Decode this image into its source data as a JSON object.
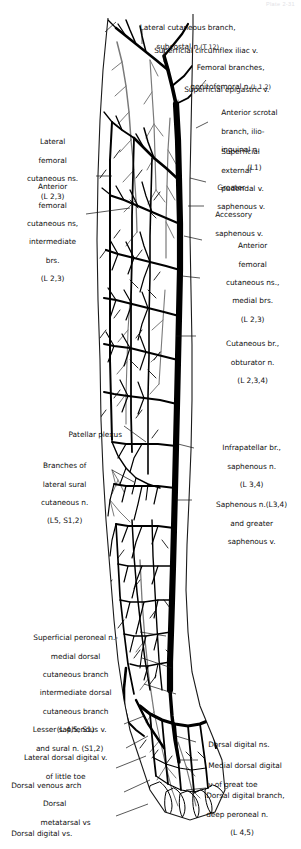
{
  "plate": {
    "header": "Plate 2-31",
    "title": "Superficial veins and cutaneous nerves of the lower limb, anterior view",
    "width": 301,
    "height": 849,
    "ink_color": "#000000",
    "nerve_color": "#6b6b6b",
    "background": "#ffffff"
  },
  "labels": {
    "lateral_cutaneous_branch_subcostal": {
      "line1": "Lateral cutaneous branch,",
      "line2": "subcostal n.",
      "roots": "(T 12)"
    },
    "superficial_circumflex_iliac_v": {
      "line1": "Superficial circumflex iliac v."
    },
    "femoral_branches_genitofemoral": {
      "line1": "Femoral branches,",
      "line2": "genitofemoral n.",
      "roots": "(L 1,2)"
    },
    "superficial_epigastric_v": {
      "line1": "Superficial epigastric v."
    },
    "lateral_femoral_cutaneous_ns": {
      "line1": "Lateral",
      "line2": "femoral",
      "line3": "cutaneous ns.",
      "roots": "(L 2,3)"
    },
    "anterior_femoral_cutaneous_intermediate": {
      "line1": "Anterior",
      "line2": "femoral",
      "line3": "cutaneous ns,",
      "line4": "intermediate",
      "line5": "brs.",
      "roots": "(L 2,3)"
    },
    "anterior_scrotal_branch": {
      "line1": "Anterior scrotal",
      "line2": "branch, ilio-",
      "line3": "inguinal n.",
      "roots": "(L1)"
    },
    "superficial_external_pudendal_v": {
      "line1": "Superficial",
      "line2": "external",
      "line3": "pudendal v."
    },
    "greater_saphenous_v": {
      "line1": "Greater",
      "line2": "saphenous v."
    },
    "accessory_saphenous_v": {
      "line1": "Accessory",
      "line2": "saphenous v."
    },
    "anterior_femoral_cutaneous_medial": {
      "line1": "Anterior",
      "line2": "femoral",
      "line3": "cutaneous ns.,",
      "line4": "medial brs.",
      "roots": "(L 2,3)"
    },
    "cutaneous_br_obturator": {
      "line1": "Cutaneous br.,",
      "line2": "obturator n.",
      "roots": "(L 2,3,4)"
    },
    "patellar_plexus": {
      "line1": "Patellar plexus"
    },
    "branches_lateral_sural_cutaneous": {
      "line1": "Branches of",
      "line2": "lateral sural",
      "line3": "cutaneous n.",
      "roots": "(L5, S1,2)"
    },
    "infrapatellar_br_saphenous": {
      "line1": "Infrapatellar br.,",
      "line2": "saphenous n.",
      "roots": "(L 3,4)"
    },
    "saphenous_n_and_greater_saphenous_v": {
      "line1": "Saphenous n.(L3,4)",
      "line2": "and greater",
      "line3": "saphenous v."
    },
    "superficial_peroneal_n": {
      "line1": "Superficial peroneal n.-",
      "line2": "medial dorsal",
      "line3": "cutaneous branch",
      "line4": "intermediate dorsal",
      "line5": "cutaneous branch",
      "roots": "(L 4,5, S1)"
    },
    "lesser_saphenous_v_and_sural_n": {
      "line1": "Lesser saphenous v.",
      "line2": "and sural n. (S1,2)"
    },
    "lateral_dorsal_digital_v_little_toe": {
      "line1": "Lateral dorsal digital v.",
      "line2": "of little toe"
    },
    "dorsal_venous_arch": {
      "line1": "Dorsal venous arch"
    },
    "dorsal_metatarsal_vs": {
      "line1": "Dorsal",
      "line2": "metatarsal vs"
    },
    "dorsal_digital_vs": {
      "line1": "Dorsal digital vs."
    },
    "dorsal_digital_ns": {
      "line1": "Dorsal digital ns."
    },
    "medial_dorsal_digital_v_great_toe": {
      "line1": "Medial dorsal digital",
      "line2": "v of great toe"
    },
    "dorsal_digital_branch_deep_peroneal": {
      "line1": "Dorsal digital branch,",
      "line2": "deep peroneal n.",
      "roots": "(L 4,5)"
    }
  }
}
